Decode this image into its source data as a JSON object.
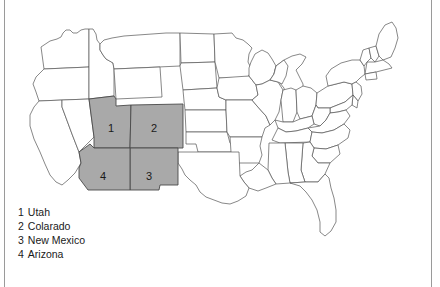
{
  "figure": {
    "title_text": "",
    "map_name": "united-states-map"
  },
  "colors": {
    "highlight_fill": "#a9a9a9",
    "state_border": "#4a4a4a",
    "outline_border": "#555555",
    "frame_rule": "#9a9a9a",
    "background": "#ffffff",
    "text": "#1a1a1a"
  },
  "legend": {
    "name": "map-legend",
    "entries": [
      {
        "number": "1",
        "label": "Utah"
      },
      {
        "number": "2",
        "label": "Colarado"
      },
      {
        "number": "3",
        "label": "New Mexico"
      },
      {
        "number": "4",
        "label": "Arizona"
      }
    ]
  },
  "map_labels": [
    {
      "number": "1",
      "state": "Utah",
      "x": 108,
      "y": 122
    },
    {
      "number": "2",
      "state": "Colorado",
      "x": 151,
      "y": 122
    },
    {
      "number": "3",
      "state": "New Mexico",
      "x": 146,
      "y": 170
    },
    {
      "number": "4",
      "state": "Arizona",
      "x": 100,
      "y": 170
    }
  ],
  "highlighted_states": [
    "Utah",
    "Colorado",
    "New Mexico",
    "Arizona"
  ]
}
